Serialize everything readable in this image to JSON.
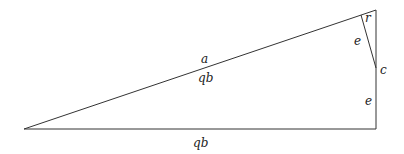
{
  "diagram": {
    "type": "right-triangle",
    "stroke_color": "#333333",
    "background": "#ffffff",
    "vertices": {
      "left": [
        24,
        129
      ],
      "top_right": [
        376,
        10
      ],
      "bottom_right": [
        376,
        129
      ],
      "c": [
        376,
        68
      ],
      "foot": [
        361,
        15
      ]
    },
    "labels": {
      "hypotenuse_above": "a",
      "hypotenuse_below": "qb",
      "corner_top": "r",
      "slant_segment": "e",
      "point_c": "c",
      "vertical_lower": "e",
      "base": "qb"
    }
  }
}
